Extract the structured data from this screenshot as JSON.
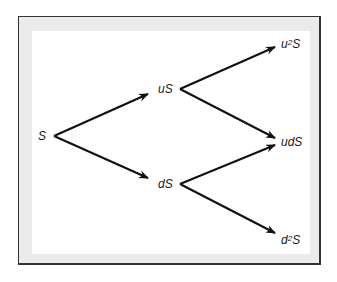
{
  "diagram": {
    "nodes": [
      {
        "id": "S",
        "label": "S"
      },
      {
        "id": "uS",
        "label": "uS"
      },
      {
        "id": "dS",
        "label": "dS"
      },
      {
        "id": "u2S",
        "base": "u",
        "sup": "2",
        "tail": "S"
      },
      {
        "id": "udS",
        "label": "udS"
      },
      {
        "id": "d2S",
        "base": "d",
        "sup": "2",
        "tail": "S"
      }
    ],
    "edges": [
      [
        "S",
        "uS"
      ],
      [
        "S",
        "dS"
      ],
      [
        "uS",
        "u2S"
      ],
      [
        "uS",
        "udS"
      ],
      [
        "dS",
        "udS"
      ],
      [
        "dS",
        "d2S"
      ]
    ]
  }
}
